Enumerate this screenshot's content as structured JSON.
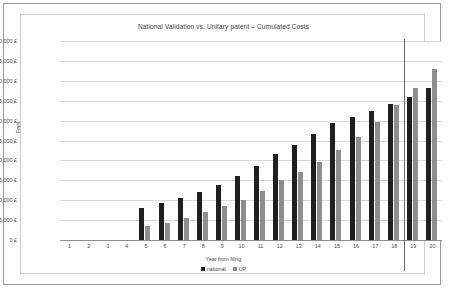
{
  "chart_data": {
    "type": "bar",
    "title": "National Validation vs. Unitary patent – Cumulated Costs",
    "xlabel": "Year from filing",
    "ylabel": "Fees",
    "grid": true,
    "legend_position": "bottom",
    "ylim": [
      0,
      50000
    ],
    "ytick_labels": [
      "50,000 £",
      "45,000 £",
      "40,000 £",
      "35,000 £",
      "30,000 £",
      "25,000 £",
      "20,000 £",
      "15,000 £",
      "10,000 £",
      "5,000 £",
      "0 £"
    ],
    "ytick_values": [
      50000,
      45000,
      40000,
      35000,
      30000,
      25000,
      20000,
      15000,
      10000,
      5000,
      0
    ],
    "categories": [
      "1",
      "2",
      "3",
      "4",
      "5",
      "6",
      "7",
      "8",
      "9",
      "10",
      "11",
      "12",
      "13",
      "14",
      "15",
      "16",
      "17",
      "18",
      "19",
      "20"
    ],
    "series": [
      {
        "name": "national",
        "color": "#1f1f1f",
        "values": [
          0,
          0,
          0,
          0,
          8100,
          9300,
          10500,
          12000,
          13900,
          16000,
          18700,
          21700,
          23800,
          26600,
          29400,
          30900,
          32500,
          34100,
          36000,
          38100
        ]
      },
      {
        "name": "UP",
        "color": "#8e8e8e",
        "values": [
          0,
          0,
          0,
          0,
          3600,
          4400,
          5600,
          7000,
          8500,
          10100,
          12400,
          15100,
          17200,
          19700,
          22700,
          25900,
          29600,
          33800,
          38300,
          43000
        ]
      }
    ],
    "annotations": [
      {
        "name": "crossover-marker",
        "type": "vertical-line",
        "between_categories": [
          "18",
          "19"
        ]
      }
    ]
  },
  "legend": {
    "items": [
      {
        "label": "national",
        "color": "#1f1f1f"
      },
      {
        "label": "UP",
        "color": "#8e8e8e"
      }
    ]
  }
}
